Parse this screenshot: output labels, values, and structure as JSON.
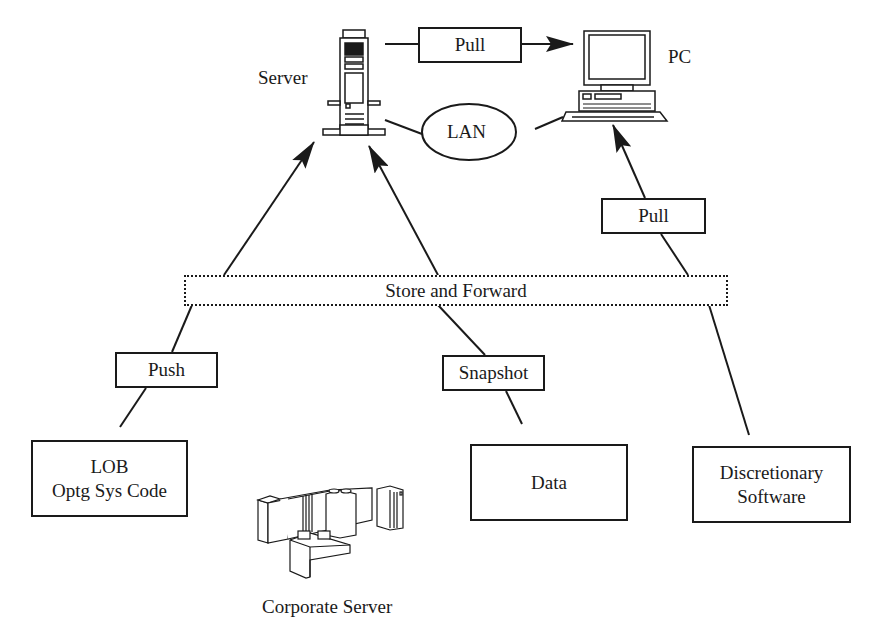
{
  "diagram": {
    "nodes": {
      "server": {
        "label": "Server",
        "icon": "tower-server-icon"
      },
      "pc": {
        "label": "PC",
        "icon": "desktop-pc-icon"
      },
      "lan": {
        "label": "LAN"
      },
      "corporate_server": {
        "label": "Corporate Server",
        "icon": "mainframe-icon"
      },
      "lob": {
        "line1": "LOB",
        "line2": "Optg Sys Code"
      },
      "data": {
        "label": "Data"
      },
      "discretionary": {
        "line1": "Discretionary",
        "line2": "Software"
      }
    },
    "edge_labels": {
      "pull_top": "Pull",
      "pull_right": "Pull",
      "push": "Push",
      "snapshot": "Snapshot",
      "store_and_forward": "Store and Forward"
    },
    "edges": [
      {
        "from": "server",
        "to": "pc",
        "label": "Pull",
        "arrow": true
      },
      {
        "from": "server",
        "to": "pc",
        "via": "LAN",
        "arrow": false
      },
      {
        "from": "lob",
        "to": "server",
        "label": "Push",
        "via": "Store and Forward",
        "arrow": true
      },
      {
        "from": "data",
        "to": "server",
        "label": "Snapshot",
        "via": "Store and Forward",
        "arrow": true
      },
      {
        "from": "discretionary",
        "to": "pc",
        "label": "Pull",
        "via": "Store and Forward",
        "arrow": true
      }
    ],
    "colors": {
      "ink": "#1a1a1a",
      "background": "#ffffff"
    }
  }
}
